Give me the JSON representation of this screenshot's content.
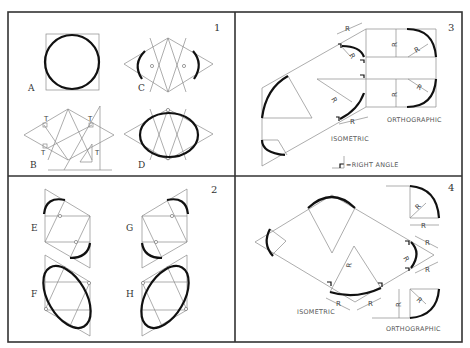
{
  "figure": {
    "panels": [
      {
        "number": "1",
        "views": [
          {
            "label": "A",
            "description": "circle inscribed in square"
          },
          {
            "label": "C",
            "description": "isometric rhombus with end arcs"
          },
          {
            "label": "B",
            "description": "rhombus with perpendiculars (T) constructed with triangle"
          },
          {
            "label": "D",
            "description": "completed four-center approximate ellipse"
          }
        ],
        "marks": [
          "T",
          "T",
          "T",
          "T",
          "T"
        ]
      },
      {
        "number": "2",
        "views": [
          {
            "label": "E",
            "description": "rhombus construction on left-leaning face"
          },
          {
            "label": "G",
            "description": "rhombus construction on right-leaning face"
          },
          {
            "label": "F",
            "description": "ellipse on left-leaning face"
          },
          {
            "label": "H",
            "description": "ellipse on right-leaning face"
          }
        ]
      },
      {
        "number": "3",
        "dimension_label": "R",
        "labels": {
          "isometric": "ISOMETRIC",
          "orthographic": "ORTHOGRAPHIC",
          "legend": "=RIGHT ANGLE"
        }
      },
      {
        "number": "4",
        "dimension_label": "R",
        "labels": {
          "isometric": "ISOMETRIC",
          "orthographic": "ORTHOGRAPHIC"
        }
      }
    ]
  }
}
